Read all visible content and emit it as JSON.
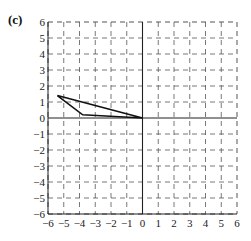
{
  "panel_label": "(c)",
  "chart_data": {
    "type": "line",
    "title": "",
    "xlabel": "",
    "ylabel": "",
    "xlim": [
      -6,
      6
    ],
    "ylim": [
      -6,
      6
    ],
    "grid": true,
    "grid_style": "dashed",
    "x_ticks": [
      -6,
      -5,
      -4,
      -3,
      -2,
      -1,
      0,
      1,
      2,
      3,
      4,
      5,
      6
    ],
    "y_ticks": [
      -6,
      -5,
      -4,
      -3,
      -2,
      -1,
      0,
      1,
      2,
      3,
      4,
      5,
      6
    ],
    "x_tick_labels": [
      "−6",
      "−5",
      "−4",
      "−3",
      "−2",
      "−1",
      "0",
      "1",
      "2",
      "3",
      "4",
      "5",
      "6"
    ],
    "y_tick_labels": [
      "−6",
      "−5",
      "−4",
      "−3",
      "−2",
      "−1",
      "0",
      "1",
      "2",
      "3",
      "4",
      "5",
      "6"
    ],
    "series": [
      {
        "name": "triangle",
        "closed": true,
        "points": [
          [
            -5.4,
            1.4
          ],
          [
            -3.8,
            0.2
          ],
          [
            0,
            0
          ]
        ]
      }
    ]
  },
  "colors": {
    "grid": "#555555",
    "axes": "#222222",
    "shape": "#111111"
  }
}
